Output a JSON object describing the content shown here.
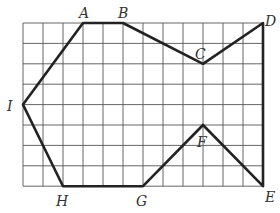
{
  "diagram": {
    "grid": {
      "cols": 12,
      "rows": 8,
      "x0": 23,
      "y0": 23,
      "dx": 20,
      "dy": 20.4,
      "line_color": "#555",
      "stroke_color": "#222"
    },
    "points": [
      {
        "name": "A",
        "col": 3,
        "row": 0
      },
      {
        "name": "B",
        "col": 5,
        "row": 0
      },
      {
        "name": "C",
        "col": 9,
        "row": 2
      },
      {
        "name": "D",
        "col": 12,
        "row": 0
      },
      {
        "name": "E",
        "col": 12,
        "row": 8
      },
      {
        "name": "F",
        "col": 9,
        "row": 5
      },
      {
        "name": "G",
        "col": 6,
        "row": 8
      },
      {
        "name": "H",
        "col": 2,
        "row": 8
      },
      {
        "name": "I",
        "col": 0,
        "row": 4
      }
    ],
    "labels": {
      "A": "A",
      "B": "B",
      "C": "C",
      "D": "D",
      "E": "E",
      "F": "F",
      "G": "G",
      "H": "H",
      "I": "I"
    }
  }
}
